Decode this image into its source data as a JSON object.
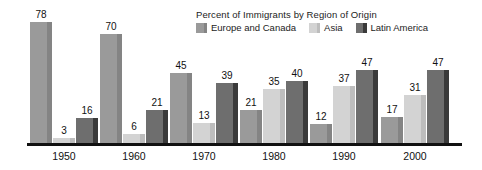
{
  "chart_data": {
    "type": "bar",
    "title": "Percent of Immigrants by Region of Origin",
    "xlabel": "",
    "ylabel": "",
    "ylim": [
      0,
      80
    ],
    "grid": false,
    "legend_position": "top-right",
    "categories": [
      "1950",
      "1960",
      "1970",
      "1980",
      "1990",
      "2000"
    ],
    "series": [
      {
        "name": "Europe and Canada",
        "color": "#9a9a9a",
        "edge_color": "#848484",
        "values": [
          78,
          70,
          45,
          21,
          12,
          17
        ]
      },
      {
        "name": "Asia",
        "color": "#d3d3d3",
        "edge_color": "#bdbdbd",
        "values": [
          3,
          6,
          13,
          35,
          37,
          31
        ]
      },
      {
        "name": "Latin America",
        "color": "#6e6e6e",
        "edge_color": "#3a3a3a",
        "values": [
          16,
          21,
          39,
          40,
          47,
          47
        ]
      }
    ]
  },
  "axis": {
    "baseline_color": "#111111"
  }
}
